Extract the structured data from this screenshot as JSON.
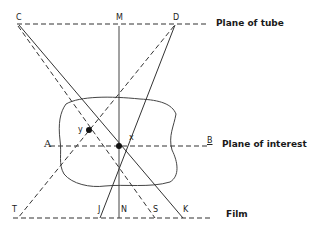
{
  "diagram": {
    "planes": {
      "tube": "Plane of tube",
      "interest": "Plane of interest",
      "film": "Film"
    },
    "points": {
      "C": "C",
      "M": "M",
      "D": "D",
      "A": "A",
      "B": "B",
      "x": "x",
      "y": "y",
      "T": "T",
      "J": "J",
      "N": "N",
      "S": "S",
      "K": "K"
    },
    "colors": {
      "line": "#333333",
      "background": "#ffffff"
    }
  }
}
